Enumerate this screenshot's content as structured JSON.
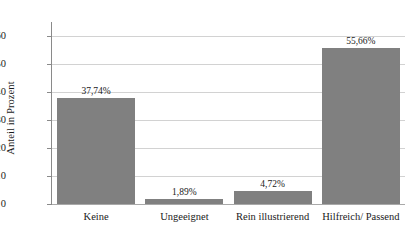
{
  "chart_data": {
    "type": "bar",
    "title": "",
    "subtitle": "",
    "xlabel": "",
    "ylabel": "Anteil in Prozent",
    "categories": [
      "Keine",
      "Ungeeignet",
      "Rein illustrierend",
      "Hilfreich/ Passend"
    ],
    "values": [
      37.74,
      1.89,
      4.72,
      55.66
    ],
    "value_labels": [
      "37,74%",
      "1,89%",
      "4,72%",
      "55,66%"
    ],
    "ylim": [
      0,
      65
    ],
    "yticks": [
      0,
      10,
      20,
      30,
      40,
      50,
      60
    ],
    "ytick_labels": [
      "0",
      "10",
      "20",
      "30",
      "40",
      "50",
      "60"
    ],
    "grid": true,
    "grid_axis": "y",
    "legend": false,
    "legend_position": "none",
    "series": [
      {
        "name": "Anteil in Prozent",
        "values": [
          37.74,
          1.89,
          4.72,
          55.66
        ]
      }
    ],
    "colors": {
      "bar_fill": "#808080",
      "grid_line": "#d2d2d2",
      "axis_line": "#8a8a8a",
      "text": "#1a1a1a",
      "background": "#ffffff"
    }
  }
}
